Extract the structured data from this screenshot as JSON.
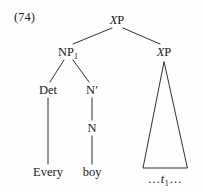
{
  "figure": {
    "example_number": "(74)",
    "caption_text": "",
    "type": "syntax-tree",
    "ink_color": "#1a1a1a",
    "background_color": "#fefefe"
  },
  "tree": {
    "root": {
      "id": "root-xp",
      "label_italic": "X",
      "label_rest": "P",
      "label_full": "XP",
      "x": 117,
      "y": 20
    },
    "nodes": [
      {
        "id": "np1",
        "label_text": "NP",
        "subscript": "1",
        "label_full": "NP1",
        "x": 68,
        "y": 52,
        "italic": false
      },
      {
        "id": "xp-right",
        "label_italic": "X",
        "label_rest": "P",
        "label_full": "XP",
        "x": 164,
        "y": 52,
        "italic": true
      },
      {
        "id": "det",
        "label_full": "Det",
        "x": 48,
        "y": 90,
        "italic": false
      },
      {
        "id": "nbar",
        "label_text": "N",
        "prime": "′",
        "label_full": "N′",
        "x": 92,
        "y": 90,
        "italic": false
      },
      {
        "id": "n",
        "label_full": "N",
        "x": 92,
        "y": 128,
        "italic": false
      }
    ],
    "terminals": [
      {
        "id": "every",
        "label_full": "Every",
        "x": 48,
        "y": 172
      },
      {
        "id": "boy",
        "label_full": "boy",
        "x": 92,
        "y": 172
      }
    ],
    "trace": {
      "id": "trace-t1",
      "leading_ellipsis": "…",
      "symbol": "t",
      "subscript": "1",
      "trailing_ellipsis": "…",
      "label_full": "… t1 …",
      "x": 165,
      "y": 179
    },
    "triangle": {
      "id": "xp-triangle",
      "apex_x": 164,
      "apex_y": 62,
      "base_left_x": 143,
      "base_right_x": 187,
      "base_y": 168
    },
    "edges": [
      {
        "from": "root-xp",
        "to": "np1",
        "x1": 112,
        "y1": 28,
        "x2": 73,
        "y2": 44
      },
      {
        "from": "root-xp",
        "to": "xp-right",
        "x1": 123,
        "y1": 28,
        "x2": 160,
        "y2": 44
      },
      {
        "from": "np1",
        "to": "det",
        "x1": 64,
        "y1": 60,
        "x2": 50,
        "y2": 82
      },
      {
        "from": "np1",
        "to": "nbar",
        "x1": 73,
        "y1": 60,
        "x2": 89,
        "y2": 82
      },
      {
        "from": "det",
        "to": "every",
        "x1": 48,
        "y1": 98,
        "x2": 48,
        "y2": 164
      },
      {
        "from": "nbar",
        "to": "n",
        "x1": 92,
        "y1": 98,
        "x2": 92,
        "y2": 120
      },
      {
        "from": "n",
        "to": "boy",
        "x1": 92,
        "y1": 136,
        "x2": 92,
        "y2": 164
      }
    ]
  }
}
